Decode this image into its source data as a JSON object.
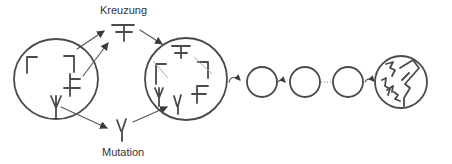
{
  "labels": {
    "crossing": "Kreuzung",
    "mutation": "Mutation"
  },
  "diagram": {
    "type": "evolution-process",
    "nodes": [
      {
        "id": "initial-population",
        "symbols": [
          "corner-left",
          "corner-right",
          "cross-f",
          "trident"
        ]
      },
      {
        "id": "crossing-result",
        "symbol": "double-cross",
        "label": "Kreuzung"
      },
      {
        "id": "mutation-result",
        "symbol": "gamma",
        "label": "Mutation"
      },
      {
        "id": "next-population",
        "symbols": [
          "double-cross",
          "corner-left",
          "corner-right",
          "trident",
          "gamma",
          "cross-f"
        ]
      },
      {
        "id": "generation-1",
        "symbols": []
      },
      {
        "id": "generation-2",
        "symbols": []
      },
      {
        "id": "generation-n",
        "symbols": []
      },
      {
        "id": "final-population",
        "symbols": [
          "complex-shapes"
        ]
      }
    ],
    "edges": [
      {
        "from": "initial-population",
        "to": "crossing-result"
      },
      {
        "from": "initial-population",
        "to": "mutation-result"
      },
      {
        "from": "crossing-result",
        "to": "next-population"
      },
      {
        "from": "mutation-result",
        "to": "next-population"
      },
      {
        "from": "next-population",
        "to": "generation-1"
      },
      {
        "from": "generation-1",
        "to": "generation-2"
      },
      {
        "from": "generation-2",
        "to": "generation-n",
        "style": "dotted"
      },
      {
        "from": "generation-n",
        "to": "final-population"
      }
    ],
    "colors": {
      "ink": "#4a4a4a",
      "background": "#ffffff"
    }
  }
}
